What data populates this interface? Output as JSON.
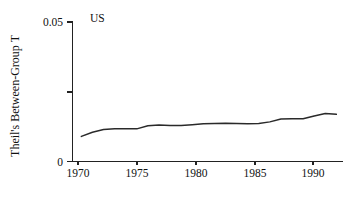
{
  "chart_data": {
    "type": "line",
    "title": "",
    "annotation": "US",
    "xlabel": "",
    "ylabel": "Theil's Between-Group T",
    "xlim": [
      1969.2,
      1993.6
    ],
    "ylim": [
      0,
      0.05
    ],
    "grid": false,
    "legend": false,
    "line_color": "#2a2a2a",
    "x_ticks": [
      1970,
      1975,
      1980,
      1985,
      1990
    ],
    "x_tick_labels": [
      "1970",
      "1975",
      "1980",
      "1985",
      "1990"
    ],
    "y_ticks": [
      0,
      0.025,
      0.05
    ],
    "y_tick_labels": [
      "0",
      "",
      "0.05"
    ],
    "x": [
      1970,
      1971,
      1972,
      1973,
      1974,
      1975,
      1976,
      1977,
      1978,
      1979,
      1980,
      1981,
      1982,
      1983,
      1984,
      1985,
      1986,
      1987,
      1988,
      1989,
      1990,
      1991,
      1992,
      1993
    ],
    "values": [
      0.009,
      0.0105,
      0.0115,
      0.0117,
      0.0117,
      0.0117,
      0.0128,
      0.0131,
      0.0129,
      0.0129,
      0.0132,
      0.0135,
      0.0136,
      0.0137,
      0.0136,
      0.0135,
      0.0136,
      0.0142,
      0.0152,
      0.0153,
      0.0153,
      0.0163,
      0.0172,
      0.0169
    ],
    "series": [
      {
        "name": "US",
        "values": [
          0.009,
          0.0105,
          0.0115,
          0.0117,
          0.0117,
          0.0117,
          0.0128,
          0.0131,
          0.0129,
          0.0129,
          0.0132,
          0.0135,
          0.0136,
          0.0137,
          0.0136,
          0.0135,
          0.0136,
          0.0142,
          0.0152,
          0.0153,
          0.0153,
          0.0163,
          0.0172,
          0.0169
        ]
      }
    ]
  },
  "axes": {
    "y_title": "Theil's Between-Group T",
    "top_label": "0.05",
    "bottom_label": "0"
  },
  "panel": {
    "label": "US"
  }
}
